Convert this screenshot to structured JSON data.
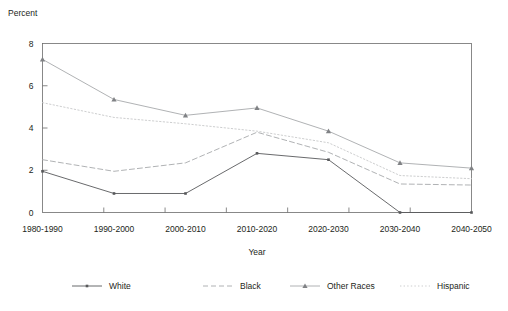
{
  "chart_data": {
    "type": "line",
    "title": "",
    "ylabel": "Percent",
    "xlabel": "Year",
    "categories": [
      "1980-1990",
      "1990-2000",
      "2000-2010",
      "2010-2020",
      "2020-2030",
      "2030-2040",
      "2040-2050"
    ],
    "ylim": [
      0,
      8
    ],
    "yticks": [
      0,
      2,
      4,
      6,
      8
    ],
    "ytick_labels": [
      "0",
      "2",
      "4",
      "6",
      "8"
    ],
    "grid": false,
    "legend_position": "bottom",
    "series": [
      {
        "name": "White",
        "style": "solid",
        "marker": "dot",
        "color": "#58595b",
        "values": [
          1.95,
          0.9,
          0.9,
          2.8,
          2.5,
          0.0,
          0.0
        ]
      },
      {
        "name": "Black",
        "style": "dashed",
        "marker": "none",
        "color": "#a7a9ac",
        "values": [
          2.5,
          1.95,
          2.35,
          3.8,
          2.85,
          1.35,
          1.3
        ]
      },
      {
        "name": "Other Races",
        "style": "solid",
        "marker": "triangle",
        "color": "#a7a9ac",
        "values": [
          7.25,
          5.35,
          4.6,
          4.95,
          3.85,
          2.35,
          2.1
        ]
      },
      {
        "name": "Hispanic",
        "style": "dotted",
        "marker": "none",
        "color": "#c7c8ca",
        "values": [
          5.2,
          4.5,
          4.2,
          3.85,
          3.3,
          1.75,
          1.6
        ]
      }
    ]
  },
  "legend": {
    "items": [
      {
        "label": "White"
      },
      {
        "label": "Black"
      },
      {
        "label": "Other Races"
      },
      {
        "label": "Hispanic"
      }
    ]
  }
}
